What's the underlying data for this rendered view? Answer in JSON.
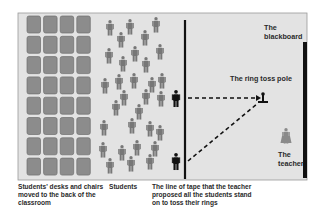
{
  "diagram": {
    "colors": {
      "frame_bg": "#e3e3e3",
      "frame_border": "#9a9a9a",
      "desk_fill": "#8c8c8c",
      "desk_border": "#6e6e6e",
      "student": "#777777",
      "highlight_student": "#111111",
      "line": "#111111",
      "teacher": "#8a8a8a"
    },
    "desks": {
      "columns": 4,
      "rows": 8
    },
    "students_count": 31,
    "labels": {
      "blackboard": [
        "The",
        "blackboard"
      ],
      "ring_toss_pole": "The ring toss pole",
      "teacher": [
        "The",
        "teacher"
      ]
    },
    "captions": {
      "desks": [
        "Students' desks and chairs",
        "moved to the back of the",
        "classroom"
      ],
      "students": "Students",
      "tape_line": [
        "The line of tape that the teacher",
        "proposed all the students stand",
        "on to toss their rings"
      ]
    }
  }
}
